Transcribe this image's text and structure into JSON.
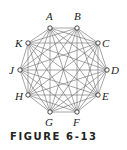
{
  "figure": {
    "caption": "FIGURE 6-13",
    "graph_type": "complete graph",
    "vertices": [
      {
        "label": "A",
        "x": 50,
        "y": 28,
        "lx": 46,
        "ly": 20
      },
      {
        "label": "B",
        "x": 77,
        "y": 28,
        "lx": 74,
        "ly": 20
      },
      {
        "label": "C",
        "x": 98,
        "y": 43,
        "lx": 102,
        "ly": 47
      },
      {
        "label": "D",
        "x": 107,
        "y": 70,
        "lx": 111,
        "ly": 74
      },
      {
        "label": "E",
        "x": 98,
        "y": 95,
        "lx": 102,
        "ly": 100
      },
      {
        "label": "F",
        "x": 77,
        "y": 112,
        "lx": 73,
        "ly": 126
      },
      {
        "label": "G",
        "x": 50,
        "y": 112,
        "lx": 45,
        "ly": 126
      },
      {
        "label": "H",
        "x": 28,
        "y": 95,
        "lx": 15,
        "ly": 100
      },
      {
        "label": "J",
        "x": 20,
        "y": 70,
        "lx": 9,
        "ly": 74
      },
      {
        "label": "K",
        "x": 28,
        "y": 43,
        "lx": 15,
        "ly": 47
      }
    ],
    "colors": {
      "edge": "#6a6a6a",
      "vertex_fill": "#ffffff",
      "vertex_stroke": "#333333"
    }
  }
}
